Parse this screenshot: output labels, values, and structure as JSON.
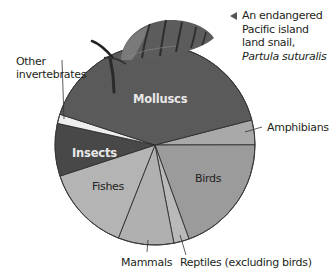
{
  "chart_data": {
    "type": "pie",
    "title": "",
    "center": [
      155,
      145
    ],
    "radius": 100,
    "start_angle_deg": -14.5,
    "slices": [
      {
        "name": "Amphibians",
        "value": 4,
        "color": "#a9a9a9",
        "label_inside": false
      },
      {
        "name": "Birds",
        "value": 19.5,
        "color": "#9b9b9b",
        "label_inside": true
      },
      {
        "name": "Reptiles (excluding birds)",
        "value": 2.5,
        "color": "#b9b9b9",
        "label_inside": false
      },
      {
        "name": "Mammals",
        "value": 9,
        "color": "#b0b0b0",
        "label_inside": false
      },
      {
        "name": "Fishes",
        "value": 14,
        "color": "#b4b4b4",
        "label_inside": true
      },
      {
        "name": "Insects",
        "value": 8.5,
        "color": "#484848",
        "label_inside": true
      },
      {
        "name": "Other invertebrates",
        "value": 1.5,
        "color": "#eeeeee",
        "label_inside": false
      },
      {
        "name": "Molluscs",
        "value": 41,
        "color": "#5a5a5a",
        "label_inside": true
      }
    ],
    "categories": [
      "Molluscs",
      "Amphibians",
      "Birds",
      "Reptiles (excluding birds)",
      "Mammals",
      "Fishes",
      "Insects",
      "Other invertebrates"
    ],
    "values": [
      41,
      4,
      19.5,
      2.5,
      9,
      14,
      8.5,
      1.5
    ],
    "legend": "none (direct labels)",
    "annotation": "An endangered Pacific island land snail, Partula suturalis"
  },
  "labels": {
    "molluscs": "Molluscs",
    "insects": "Insects",
    "fishes": "Fishes",
    "birds": "Birds",
    "amphibians": "Amphibians",
    "mammals": "Mammals",
    "reptiles": "Reptiles (excluding birds)",
    "other_line1": "Other",
    "other_line2": "invertebrates"
  },
  "caption": {
    "line1": "An endangered",
    "line2": "Pacific island",
    "line3": "land snail,",
    "line4": "Partula suturalis"
  },
  "icons": {
    "snail": "snail-illustration",
    "pointer": "left-triangle-pointer"
  }
}
